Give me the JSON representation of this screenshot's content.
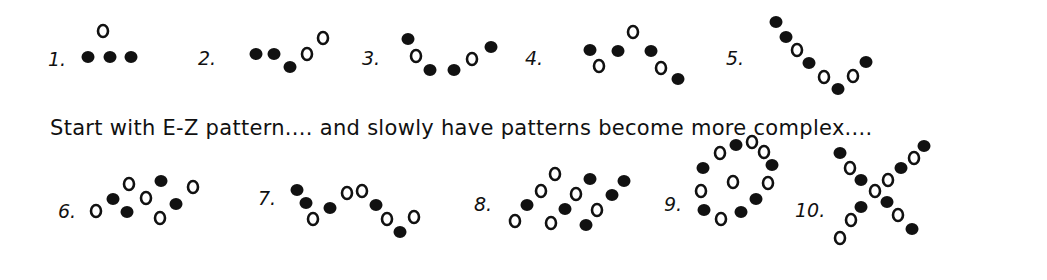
{
  "caption": "Start with E-Z pattern.... and slowly have patterns become more complex....",
  "patterns": [
    {
      "label": "1.",
      "label_pos": [
        48,
        48
      ],
      "filled": [
        [
          88,
          57
        ],
        [
          110,
          57
        ],
        [
          131,
          57
        ]
      ],
      "open": [
        [
          103,
          31
        ]
      ]
    },
    {
      "label": "2.",
      "label_pos": [
        198,
        47
      ],
      "filled": [
        [
          256,
          54
        ],
        [
          274,
          54
        ],
        [
          290,
          67
        ]
      ],
      "open": [
        [
          307,
          54
        ],
        [
          323,
          38
        ]
      ]
    },
    {
      "label": "3.",
      "label_pos": [
        362,
        47
      ],
      "filled": [
        [
          408,
          39
        ],
        [
          430,
          70
        ],
        [
          454,
          70
        ],
        [
          491,
          47
        ]
      ],
      "open": [
        [
          416,
          56
        ],
        [
          472,
          59
        ]
      ]
    },
    {
      "label": "4.",
      "label_pos": [
        525,
        47
      ],
      "filled": [
        [
          590,
          50
        ],
        [
          618,
          51
        ],
        [
          651,
          51
        ],
        [
          678,
          79
        ]
      ],
      "open": [
        [
          599,
          66
        ],
        [
          633,
          32
        ],
        [
          661,
          68
        ]
      ]
    },
    {
      "label": "5.",
      "label_pos": [
        726,
        47
      ],
      "filled": [
        [
          776,
          22
        ],
        [
          786,
          37
        ],
        [
          809,
          63
        ],
        [
          838,
          89
        ],
        [
          866,
          62
        ]
      ],
      "open": [
        [
          797,
          50
        ],
        [
          824,
          77
        ],
        [
          853,
          76
        ]
      ]
    },
    {
      "label": "6.",
      "label_pos": [
        58,
        200
      ],
      "filled": [
        [
          113,
          199
        ],
        [
          127,
          212
        ],
        [
          161,
          181
        ],
        [
          176,
          204
        ]
      ],
      "open": [
        [
          96,
          211
        ],
        [
          129,
          184
        ],
        [
          146,
          198
        ],
        [
          160,
          218
        ],
        [
          193,
          187
        ]
      ]
    },
    {
      "label": "7.",
      "label_pos": [
        258,
        187
      ],
      "filled": [
        [
          297,
          190
        ],
        [
          306,
          203
        ],
        [
          330,
          208
        ],
        [
          376,
          205
        ],
        [
          400,
          232
        ]
      ],
      "open": [
        [
          313,
          219
        ],
        [
          347,
          193
        ],
        [
          362,
          191
        ],
        [
          387,
          219
        ],
        [
          414,
          217
        ]
      ]
    },
    {
      "label": "8.",
      "label_pos": [
        474,
        193
      ],
      "filled": [
        [
          527,
          205
        ],
        [
          565,
          209
        ],
        [
          590,
          179
        ],
        [
          586,
          225
        ],
        [
          612,
          195
        ],
        [
          624,
          181
        ]
      ],
      "open": [
        [
          515,
          221
        ],
        [
          541,
          191
        ],
        [
          555,
          174
        ],
        [
          551,
          223
        ],
        [
          576,
          194
        ],
        [
          597,
          210
        ]
      ]
    },
    {
      "label": "9.",
      "label_pos": [
        664,
        193
      ],
      "filled": [
        [
          736,
          145
        ],
        [
          703,
          168
        ],
        [
          772,
          165
        ],
        [
          756,
          199
        ],
        [
          704,
          210
        ],
        [
          741,
          212
        ]
      ],
      "open": [
        [
          720,
          153
        ],
        [
          752,
          142
        ],
        [
          764,
          152
        ],
        [
          701,
          191
        ],
        [
          733,
          182
        ],
        [
          768,
          183
        ],
        [
          721,
          219
        ]
      ]
    },
    {
      "label": "10.",
      "label_pos": [
        795,
        199
      ],
      "filled": [
        [
          840,
          153
        ],
        [
          861,
          180
        ],
        [
          887,
          202
        ],
        [
          912,
          229
        ],
        [
          861,
          207
        ],
        [
          901,
          168
        ],
        [
          924,
          146
        ]
      ],
      "open": [
        [
          850,
          168
        ],
        [
          875,
          191
        ],
        [
          898,
          215
        ],
        [
          888,
          180
        ],
        [
          914,
          158
        ],
        [
          851,
          220
        ],
        [
          840,
          238
        ]
      ]
    }
  ],
  "colors": {
    "ink": "#111111",
    "background": "#ffffff"
  }
}
